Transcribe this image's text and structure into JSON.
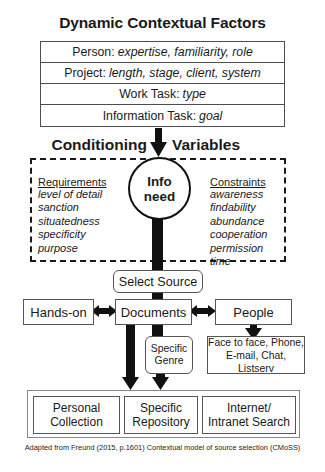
{
  "diagram": {
    "title": "Dynamic Contextual Factors",
    "caption": "Adapted from Freund (2015, p.1601) Contextual model of source selection (CMoSS)",
    "accent_color": "#111111",
    "border_color": "#555555"
  },
  "factors": {
    "rows": [
      {
        "label": "Person:",
        "values": "expertise, familiarity, role"
      },
      {
        "label": "Project:",
        "values": "length, stage, client, system"
      },
      {
        "label": "Work Task:",
        "values": "type"
      },
      {
        "label": "Information Task:",
        "values": "goal"
      }
    ]
  },
  "conditioning": {
    "heading_left": "Conditioning",
    "heading_right": "Variables",
    "center_node": {
      "line1": "Info",
      "line2": "need"
    },
    "requirements": {
      "heading": "Requirements",
      "items": [
        "level of detail",
        "sanction",
        "situatedness",
        "specificity",
        "purpose"
      ]
    },
    "constraints": {
      "heading": "Constraints",
      "items": [
        "awareness",
        "findability",
        "abundance",
        "cooperation",
        "permission",
        "time"
      ]
    }
  },
  "selection": {
    "select_source": "Select Source",
    "sources": [
      {
        "label": "Hands-on"
      },
      {
        "label": "Documents"
      },
      {
        "label": "People"
      }
    ],
    "genre": {
      "line1": "Specific",
      "line2": "Genre"
    },
    "communication": {
      "line1": "Face to face, Phone,",
      "line2": "E-mail, Chat, Listserv"
    }
  },
  "outcomes": {
    "items": [
      {
        "line1": "Personal",
        "line2": "Collection"
      },
      {
        "line1": "Specific",
        "line2": "Repository"
      },
      {
        "line1": "Internet/",
        "line2": "Intranet Search"
      }
    ]
  }
}
